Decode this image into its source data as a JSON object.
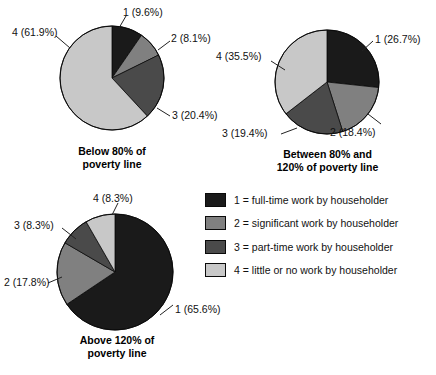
{
  "figure": {
    "title": "",
    "colors": {
      "cat1": "#1a1a1a",
      "cat2": "#808080",
      "cat3": "#4a4a4a",
      "cat4": "#c8c8c8",
      "outline": "#0a0a0a",
      "leader": "#222222",
      "background": "#ffffff"
    }
  },
  "legend": {
    "items": [
      {
        "key": "1",
        "label": "1 = full-time work by householder",
        "color": "#1a1a1a"
      },
      {
        "key": "2",
        "label": "2 = significant work by householder",
        "color": "#808080"
      },
      {
        "key": "3",
        "label": "3 = part-time work by householder",
        "color": "#4a4a4a"
      },
      {
        "key": "4",
        "label": "4 = little or no work by householder",
        "color": "#c8c8c8"
      }
    ]
  },
  "pies": [
    {
      "id": "pie-below-80",
      "caption_line1": "Below 80% of",
      "caption_line2": "poverty line",
      "labels": {
        "cat1": "1 (9.6%)",
        "cat2": "2 (8.1%)",
        "cat3": "3 (20.4%)",
        "cat4": "4 (61.9%)"
      }
    },
    {
      "id": "pie-between-80-120",
      "caption_line1": "Between 80% and",
      "caption_line2": "120% of poverty line",
      "labels": {
        "cat1": "1 (26.7%)",
        "cat2": "2 (18.4%)",
        "cat3": "3 (19.4%)",
        "cat4": "4 (35.5%)"
      }
    },
    {
      "id": "pie-above-120",
      "caption_line1": "Above 120% of",
      "caption_line2": "poverty line",
      "labels": {
        "cat1": "1 (65.6%)",
        "cat2": "2 (17.8%)",
        "cat3": "3 (8.3%)",
        "cat4": "4 (8.3%)"
      }
    }
  ],
  "chart_data": [
    {
      "type": "pie",
      "title": "Below 80% of poverty line",
      "categories": [
        "1 = full-time work by householder",
        "2 = significant work by householder",
        "3 = part-time work by householder",
        "4 = little or no work by householder"
      ],
      "labels": [
        "1",
        "2",
        "3",
        "4"
      ],
      "values": [
        9.6,
        8.1,
        20.4,
        61.9
      ],
      "value_unit": "percent",
      "data_labels": [
        "1 (9.6%)",
        "2 (8.1%)",
        "3 (20.4%)",
        "4 (61.9%)"
      ],
      "colors": [
        "#1a1a1a",
        "#808080",
        "#4a4a4a",
        "#c8c8c8"
      ],
      "start_angle_deg": 90,
      "direction": "clockwise",
      "legend_position": "right",
      "grid": false
    },
    {
      "type": "pie",
      "title": "Between 80% and 120% of poverty line",
      "categories": [
        "1 = full-time work by householder",
        "2 = significant work by householder",
        "3 = part-time work by householder",
        "4 = little or no work by householder"
      ],
      "labels": [
        "1",
        "2",
        "3",
        "4"
      ],
      "values": [
        26.7,
        18.4,
        19.4,
        35.5
      ],
      "value_unit": "percent",
      "data_labels": [
        "1 (26.7%)",
        "2 (18.4%)",
        "3 (19.4%)",
        "4 (35.5%)"
      ],
      "colors": [
        "#1a1a1a",
        "#808080",
        "#4a4a4a",
        "#c8c8c8"
      ],
      "start_angle_deg": 90,
      "direction": "clockwise",
      "legend_position": "right",
      "grid": false
    },
    {
      "type": "pie",
      "title": "Above 120% of poverty line",
      "categories": [
        "1 = full-time work by householder",
        "2 = significant work by householder",
        "3 = part-time work by householder",
        "4 = little or no work by householder"
      ],
      "labels": [
        "1",
        "2",
        "3",
        "4"
      ],
      "values": [
        65.6,
        17.8,
        8.3,
        8.3
      ],
      "value_unit": "percent",
      "data_labels": [
        "1 (65.6%)",
        "2 (17.8%)",
        "3 (8.3%)",
        "4 (8.3%)"
      ],
      "colors": [
        "#1a1a1a",
        "#808080",
        "#4a4a4a",
        "#c8c8c8"
      ],
      "start_angle_deg": 90,
      "direction": "clockwise",
      "legend_position": "right",
      "grid": false
    }
  ]
}
